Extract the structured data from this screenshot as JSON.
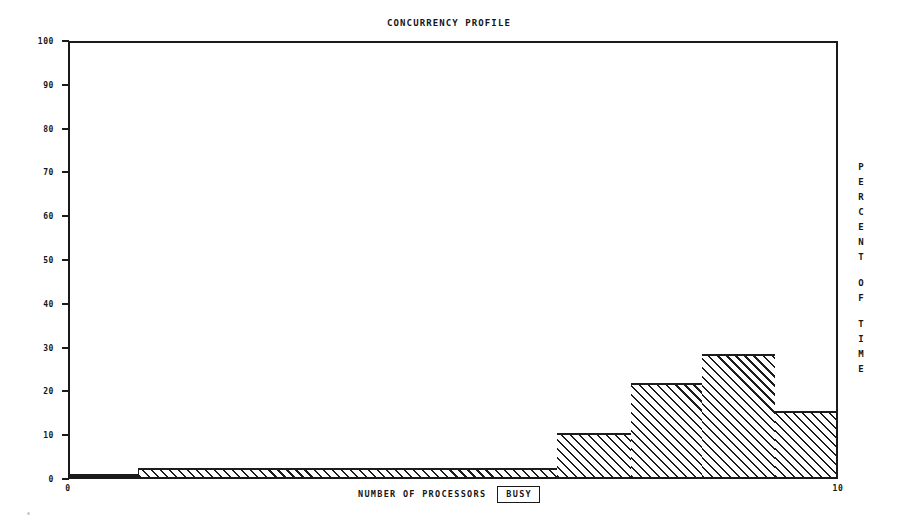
{
  "chart": {
    "title": "CONCURRENCY PROFILE",
    "xlabel_text": "NUMBER OF PROCESSORS",
    "xlabel_boxed": "BUSY",
    "right_label": "PERCENT OF TIME",
    "y_ticks": [
      "0",
      "10",
      "20",
      "30",
      "40",
      "50",
      "60",
      "70",
      "80",
      "90",
      "100"
    ],
    "x_ticks": [
      "0",
      "10"
    ],
    "ink_color": "#1c1c1c",
    "background_color": "#ffffff"
  },
  "chart_data": {
    "type": "bar",
    "title": "CONCURRENCY PROFILE",
    "xlabel": "NUMBER OF PROCESSORS BUSY",
    "ylabel": "PERCENT OF TIME",
    "xlim": [
      0,
      10
    ],
    "ylim": [
      0,
      100
    ],
    "grid": false,
    "legend": null,
    "style": "step-histogram, 45-degree diagonal hatch fill, monochrome",
    "categories": [
      "0.9-6.3",
      "6.3-7.3",
      "7.3-8.2",
      "8.2-9.2",
      "9.2-10"
    ],
    "values": [
      2,
      10,
      21.5,
      28,
      15
    ],
    "steps": [
      {
        "x_start": 0.88,
        "x_end": 6.33,
        "percent_of_time": 2
      },
      {
        "x_start": 6.33,
        "x_end": 7.28,
        "percent_of_time": 10
      },
      {
        "x_start": 7.28,
        "x_end": 8.21,
        "percent_of_time": 21.5
      },
      {
        "x_start": 8.21,
        "x_end": 9.15,
        "percent_of_time": 28
      },
      {
        "x_start": 9.15,
        "x_end": 10.0,
        "percent_of_time": 15
      }
    ]
  }
}
